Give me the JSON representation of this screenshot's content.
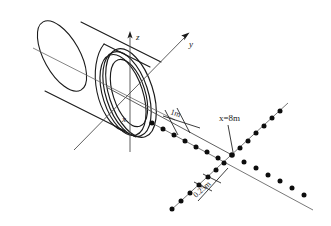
{
  "figure": {
    "type": "technical-line-drawing",
    "stroke_color": "#1a1a1a",
    "axis_color": "#555555",
    "background_color": "#ffffff"
  },
  "axes": {
    "z_label": "z",
    "y_label": "y",
    "x_label": "x"
  },
  "annotations": {
    "spacing_coarse": "1m",
    "spacing_fine": "0.25m",
    "station": "x=8m"
  },
  "measurement_grid": {
    "arm_upper_left_points": 9,
    "arm_lower_right_points": 9,
    "arm_lower_left_points": 9,
    "arm_upper_right_points": 9,
    "coarse_spacing_value": "1m",
    "fine_spacing_value": "0.25m",
    "station_value": "x=8m"
  }
}
